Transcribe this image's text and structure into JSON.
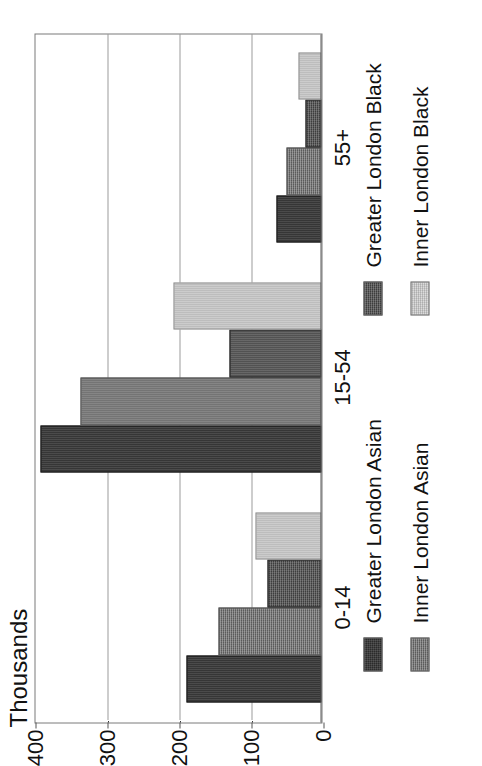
{
  "chart_data": {
    "type": "bar",
    "title": "",
    "subtitle": "",
    "orientation": "rotated-90-ccw",
    "xlabel": "",
    "ylabel": "Thousands",
    "ylim": [
      0,
      400
    ],
    "yticks": [
      0,
      100,
      200,
      300,
      400
    ],
    "ytick_labels": [
      "0",
      "100",
      "200",
      "300",
      "400"
    ],
    "grid": "value-axis dotted gridlines at 100, 200, 300",
    "legend_position": "right, two stacked blocks",
    "categories": [
      "0-14",
      "15-54",
      "55+"
    ],
    "series": [
      {
        "name": "Greater London Asian",
        "color": "#2b2b2b",
        "values": [
          188,
          390,
          62
        ]
      },
      {
        "name": "Inner London Asian",
        "color": "#6f6f6f",
        "values": [
          143,
          335,
          48
        ]
      },
      {
        "name": "Greater London Black",
        "color": "#3d3d3d",
        "values": [
          75,
          128,
          22
        ]
      },
      {
        "name": "Inner London Black",
        "color": "#dcdcdc",
        "values": [
          92,
          205,
          32
        ]
      }
    ]
  },
  "axis": {
    "value_axis_title": "Thousands",
    "tick_labels": [
      "400",
      "300",
      "200",
      "100",
      "0"
    ],
    "category_labels": [
      "0-14",
      "15-54",
      "55+"
    ]
  },
  "legend": {
    "block_asian": {
      "items": [
        {
          "label": "Greater London Asian",
          "swatch": "gl-asian"
        },
        {
          "label": "Inner London Asian",
          "swatch": "il-asian"
        }
      ]
    },
    "block_black": {
      "items": [
        {
          "label": "Greater London Black",
          "swatch": "gl-black"
        },
        {
          "label": "Inner London Black",
          "swatch": "il-black"
        }
      ]
    }
  },
  "colors": {
    "greater_london_asian": "#2b2b2b",
    "inner_london_asian": "#6f6f6f",
    "greater_london_black": "#3d3d3d",
    "inner_london_black": "#dcdcdc",
    "frame": "#7a7a7a",
    "gridline": "#3a3a3a",
    "background": "#ffffff",
    "text": "#111111"
  }
}
